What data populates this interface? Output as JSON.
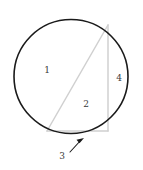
{
  "figure": {
    "background_color": "#ffffff",
    "circle": {
      "name": "circle-outline",
      "center_x": 71,
      "center_y": 76.5,
      "radius": 57,
      "stroke_color": "#1a1a1a",
      "stroke_width": 1.6,
      "fill": "none"
    },
    "triangle": {
      "name": "inscribed-triangle",
      "stroke_color": "#d0d0d0",
      "stroke_width": 1.5,
      "fill": "none",
      "vertices": [
        {
          "name": "top-right-vertex",
          "x": 108,
          "y": 25
        },
        {
          "name": "bottom-left-vertex",
          "x": 47,
          "y": 131
        },
        {
          "name": "bottom-right-vertex",
          "x": 108,
          "y": 131
        }
      ],
      "sides": [
        {
          "name": "hypotenuse",
          "from": "bottom-left-vertex",
          "to": "top-right-vertex"
        },
        {
          "name": "vertical-leg",
          "from": "top-right-vertex",
          "to": "bottom-right-vertex"
        },
        {
          "name": "horizontal-leg",
          "from": "bottom-left-vertex",
          "to": "bottom-right-vertex"
        }
      ]
    },
    "labels": [
      {
        "name": "region-label-1",
        "text": "1",
        "x": 47,
        "y": 70,
        "describes": "upper-left circular segment region"
      },
      {
        "name": "region-label-2",
        "text": "2",
        "x": 86,
        "y": 104,
        "describes": "triangle interior region"
      },
      {
        "name": "region-label-4",
        "text": "4",
        "x": 119,
        "y": 78,
        "describes": "right circular segment region"
      },
      {
        "name": "region-label-3",
        "text": "3",
        "x": 62,
        "y": 156,
        "describes": "bottom arc segment region, pointed to by arrow"
      }
    ],
    "arrow": {
      "name": "callout-arrow-3",
      "color": "#1a1a1a",
      "stroke_width": 1.1,
      "tail_x": 70,
      "tail_y": 152,
      "tip_x": 83,
      "tip_y": 138.5,
      "head_size": 5
    }
  }
}
